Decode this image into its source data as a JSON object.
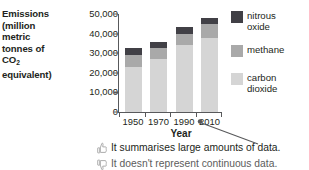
{
  "chart_data": {
    "type": "bar",
    "subtype": "stacked-bar",
    "title": "",
    "xlabel": "Year",
    "ylabel": "Emissions (million metric tonnes of CO2 equivalent)",
    "categories": [
      "1950",
      "1970",
      "1990",
      "2010"
    ],
    "series": [
      {
        "name": "carbon dioxide",
        "color": "#d5d5d5",
        "values": [
          23000,
          27000,
          34000,
          38000
        ]
      },
      {
        "name": "methane",
        "color": "#a9a9a9",
        "values": [
          6000,
          5500,
          6000,
          7000
        ]
      },
      {
        "name": "nitrous oxide",
        "color": "#414046",
        "values": [
          3500,
          3000,
          3500,
          3000
        ]
      }
    ],
    "totals": [
      32500,
      35500,
      43500,
      48000
    ],
    "ylim": [
      0,
      50000
    ],
    "yticks": [
      "0",
      "10,000",
      "20,000",
      "30,000",
      "40,000",
      "50,000"
    ],
    "ytick_values": [
      0,
      10000,
      20000,
      30000,
      40000,
      50000
    ],
    "xtick_labels": [
      "1950",
      "1970",
      "1990",
      "2010"
    ],
    "grid": false,
    "legend_position": "right",
    "legend_entries": [
      "nitrous oxide",
      "methane",
      "carbon dioxide"
    ]
  },
  "axis": {
    "y_title_lines": [
      "Emissions",
      "(million",
      "metric",
      "tonnes of",
      "CO",
      "equivalent)"
    ],
    "y_title_subscript": "2",
    "x_title": "Year"
  },
  "legend": {
    "items": [
      {
        "label": "nitrous\noxide",
        "color": "#414046"
      },
      {
        "label": "methane",
        "color": "#a9a9a9"
      },
      {
        "label": "carbon\ndioxide",
        "color": "#d5d5d5"
      }
    ]
  },
  "notes": [
    {
      "icon": "thumbs-up-icon",
      "text": "It summarises large amounts of data."
    },
    {
      "icon": "thumbs-down-icon",
      "text": "It doesn't represent continuous data."
    }
  ],
  "colors": {
    "axis": "#58595b",
    "text": "#231f20",
    "nitrous_oxide": "#414046",
    "methane": "#a9a9a9",
    "carbon_dioxide": "#d5d5d5"
  }
}
